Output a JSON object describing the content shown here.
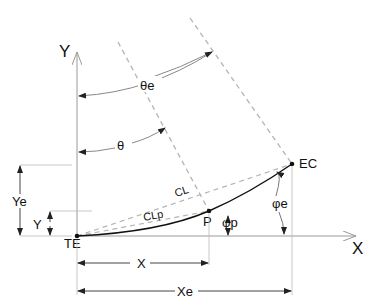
{
  "diagram": {
    "type": "transition-curve-geometry",
    "colors": {
      "curve": "#111111",
      "axis": "#9a9a9a",
      "dashed": "#b4b4b4",
      "dim": "#555555",
      "text": "#111111",
      "background": "#ffffff"
    },
    "axes": {
      "x_label": "X",
      "y_label": "Y"
    },
    "points": {
      "start": "TE",
      "end": "EC",
      "intermediate": "P"
    },
    "chords": {
      "full": "CL",
      "partial": "CLp"
    },
    "angles": {
      "theta_end": "θe",
      "theta": "θ",
      "phi_end": "φe",
      "phi_p": "φp"
    },
    "dimensions": {
      "x": "X",
      "x_end": "Xe",
      "y": "Y",
      "y_end": "Ye"
    }
  }
}
